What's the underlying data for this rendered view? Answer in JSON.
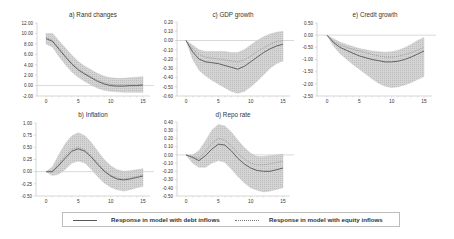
{
  "chart_data": [
    {
      "id": "a",
      "type": "line",
      "title": "a) Rand changes",
      "x": [
        0,
        1,
        2,
        3,
        4,
        5,
        6,
        7,
        8,
        9,
        10,
        11,
        12,
        13,
        14,
        15
      ],
      "xticks": [
        "0",
        "5",
        "10",
        "15"
      ],
      "ylim": [
        -2,
        12
      ],
      "yticks": [
        "12.00",
        "10.00",
        "8.00",
        "6.00",
        "4.00",
        "2.00",
        "0.00",
        "-2.00"
      ],
      "series": [
        {
          "name": "Response in model with debt inflows",
          "style": "solid",
          "values": [
            9.0,
            8.5,
            7.0,
            5.5,
            4.1,
            3.0,
            2.2,
            1.5,
            0.8,
            0.3,
            0.0,
            -0.1,
            -0.1,
            0.0,
            0.0,
            0.1
          ]
        },
        {
          "name": "Response in model with equity inflows",
          "style": "dotted",
          "values": [
            9.2,
            8.7,
            7.2,
            5.7,
            4.3,
            3.2,
            2.4,
            1.7,
            1.0,
            0.5,
            0.2,
            0.1,
            0.1,
            0.1,
            0.1,
            0.2
          ]
        }
      ],
      "band_upper": [
        10.0,
        10.0,
        8.6,
        7.2,
        5.8,
        4.6,
        3.7,
        3.0,
        2.3,
        1.8,
        1.5,
        1.4,
        1.4,
        1.5,
        1.6,
        1.7
      ],
      "band_lower": [
        8.0,
        7.4,
        5.6,
        4.0,
        2.6,
        1.6,
        0.8,
        0.1,
        -0.5,
        -0.9,
        -1.1,
        -1.2,
        -1.3,
        -1.3,
        -1.3,
        -1.3
      ]
    },
    {
      "id": "c",
      "type": "line",
      "title": "c) GDP growth",
      "x": [
        0,
        1,
        2,
        3,
        4,
        5,
        6,
        7,
        8,
        9,
        10,
        11,
        12,
        13,
        14,
        15
      ],
      "xticks": [
        "0",
        "5",
        "10",
        "15"
      ],
      "ylim": [
        -0.6,
        0.2
      ],
      "yticks": [
        "0.20",
        "0.10",
        "0.00",
        "-0.10",
        "-0.20",
        "-0.30",
        "-0.40",
        "-0.50",
        "-0.60"
      ],
      "series": [
        {
          "name": "Response in model with debt inflows",
          "style": "solid",
          "values": [
            0.0,
            -0.12,
            -0.2,
            -0.23,
            -0.24,
            -0.25,
            -0.27,
            -0.29,
            -0.31,
            -0.28,
            -0.23,
            -0.18,
            -0.13,
            -0.09,
            -0.06,
            -0.04
          ]
        },
        {
          "name": "Response in model with equity inflows",
          "style": "dotted",
          "values": [
            0.0,
            -0.09,
            -0.15,
            -0.18,
            -0.19,
            -0.2,
            -0.21,
            -0.22,
            -0.23,
            -0.21,
            -0.17,
            -0.12,
            -0.08,
            -0.04,
            -0.01,
            0.0
          ]
        }
      ],
      "band_upper": [
        0.0,
        -0.05,
        -0.1,
        -0.12,
        -0.12,
        -0.12,
        -0.12,
        -0.13,
        -0.13,
        -0.1,
        -0.05,
        0.0,
        0.04,
        0.07,
        0.09,
        0.1
      ],
      "band_lower": [
        0.0,
        -0.2,
        -0.32,
        -0.38,
        -0.43,
        -0.47,
        -0.51,
        -0.55,
        -0.57,
        -0.55,
        -0.5,
        -0.44,
        -0.37,
        -0.3,
        -0.25,
        -0.22
      ]
    },
    {
      "id": "e",
      "type": "line",
      "title": "e) Credit growth",
      "x": [
        0,
        1,
        2,
        3,
        4,
        5,
        6,
        7,
        8,
        9,
        10,
        11,
        12,
        13,
        14,
        15
      ],
      "xticks": [
        "0",
        "5",
        "10",
        "15"
      ],
      "ylim": [
        -2.5,
        0.5
      ],
      "yticks": [
        "0.50",
        "0.00",
        "-0.50",
        "-1.00",
        "-1.50",
        "-2.00",
        "-2.50"
      ],
      "series": [
        {
          "name": "Response in model with debt inflows",
          "style": "solid",
          "values": [
            0.0,
            -0.3,
            -0.5,
            -0.62,
            -0.74,
            -0.85,
            -0.93,
            -1.0,
            -1.05,
            -1.1,
            -1.1,
            -1.07,
            -1.0,
            -0.9,
            -0.78,
            -0.65
          ]
        },
        {
          "name": "Response in model with equity inflows",
          "style": "dotted",
          "values": [
            0.0,
            -0.25,
            -0.4,
            -0.5,
            -0.58,
            -0.65,
            -0.72,
            -0.8,
            -0.85,
            -0.9,
            -0.9,
            -0.87,
            -0.8,
            -0.72,
            -0.62,
            -0.5
          ]
        }
      ],
      "band_upper": [
        0.0,
        -0.15,
        -0.28,
        -0.38,
        -0.47,
        -0.55,
        -0.6,
        -0.65,
        -0.68,
        -0.7,
        -0.68,
        -0.62,
        -0.52,
        -0.38,
        -0.22,
        -0.1
      ],
      "band_lower": [
        0.0,
        -0.45,
        -0.75,
        -0.98,
        -1.2,
        -1.4,
        -1.6,
        -1.8,
        -1.98,
        -2.1,
        -2.15,
        -2.12,
        -2.05,
        -1.95,
        -1.82,
        -1.7
      ]
    },
    {
      "id": "b",
      "type": "line",
      "title": "b) Inflation",
      "x": [
        0,
        1,
        2,
        3,
        4,
        5,
        6,
        7,
        8,
        9,
        10,
        11,
        12,
        13,
        14,
        15
      ],
      "xticks": [
        "0",
        "5",
        "10",
        "15"
      ],
      "ylim": [
        -0.5,
        1.0
      ],
      "yticks": [
        "1.00",
        "0.75",
        "0.50",
        "0.25",
        "0.00",
        "-0.25",
        "-0.50"
      ],
      "series": [
        {
          "name": "Response in model with debt inflows",
          "style": "solid",
          "values": [
            0.0,
            0.0,
            0.13,
            0.28,
            0.42,
            0.47,
            0.42,
            0.3,
            0.15,
            0.01,
            -0.09,
            -0.15,
            -0.17,
            -0.15,
            -0.12,
            -0.09
          ]
        },
        {
          "name": "Response in model with equity inflows",
          "style": "dotted",
          "values": [
            0.0,
            0.02,
            0.17,
            0.33,
            0.46,
            0.5,
            0.45,
            0.33,
            0.18,
            0.03,
            -0.07,
            -0.13,
            -0.15,
            -0.13,
            -0.1,
            -0.07
          ]
        }
      ],
      "band_upper": [
        0.0,
        0.1,
        0.35,
        0.58,
        0.74,
        0.8,
        0.74,
        0.6,
        0.42,
        0.25,
        0.12,
        0.04,
        0.01,
        0.02,
        0.04,
        0.06
      ],
      "band_lower": [
        0.0,
        -0.08,
        -0.05,
        0.05,
        0.18,
        0.22,
        0.18,
        0.05,
        -0.1,
        -0.23,
        -0.32,
        -0.37,
        -0.4,
        -0.37,
        -0.33,
        -0.3
      ]
    },
    {
      "id": "d",
      "type": "line",
      "title": "d) Repo rate",
      "x": [
        0,
        1,
        2,
        3,
        4,
        5,
        6,
        7,
        8,
        9,
        10,
        11,
        12,
        13,
        14,
        15
      ],
      "xticks": [
        "0",
        "5",
        "10",
        "15"
      ],
      "ylim": [
        -0.5,
        0.4
      ],
      "yticks": [
        "0.40",
        "0.30",
        "0.20",
        "0.10",
        "0.00",
        "-0.10",
        "-0.20",
        "-0.30",
        "-0.40",
        "-0.50"
      ],
      "series": [
        {
          "name": "Response in model with debt inflows",
          "style": "solid",
          "values": [
            0.0,
            -0.03,
            -0.07,
            -0.01,
            0.07,
            0.13,
            0.12,
            0.05,
            -0.04,
            -0.11,
            -0.16,
            -0.19,
            -0.2,
            -0.2,
            -0.18,
            -0.16
          ]
        },
        {
          "name": "Response in model with equity inflows",
          "style": "dotted",
          "values": [
            0.0,
            -0.02,
            -0.04,
            0.04,
            0.14,
            0.2,
            0.18,
            0.11,
            0.02,
            -0.05,
            -0.1,
            -0.12,
            -0.12,
            -0.11,
            -0.09,
            -0.08
          ]
        }
      ],
      "band_upper": [
        0.0,
        0.0,
        0.05,
        0.17,
        0.3,
        0.37,
        0.35,
        0.28,
        0.18,
        0.09,
        0.02,
        -0.02,
        -0.02,
        -0.01,
        0.0,
        0.01
      ],
      "band_lower": [
        0.0,
        -0.1,
        -0.15,
        -0.15,
        -0.1,
        -0.07,
        -0.09,
        -0.17,
        -0.26,
        -0.34,
        -0.4,
        -0.43,
        -0.45,
        -0.44,
        -0.42,
        -0.4
      ]
    }
  ],
  "legend": {
    "items": [
      {
        "label": "Response in model with debt inflows",
        "style": "solid"
      },
      {
        "label": "Response in model with equity inflows",
        "style": "dotted"
      }
    ]
  },
  "colors": {
    "band": "#cfcfcf",
    "line": "#555555",
    "zero_line": "#c8c8c8",
    "axis": "#bdbdbd",
    "text": "#333333"
  }
}
